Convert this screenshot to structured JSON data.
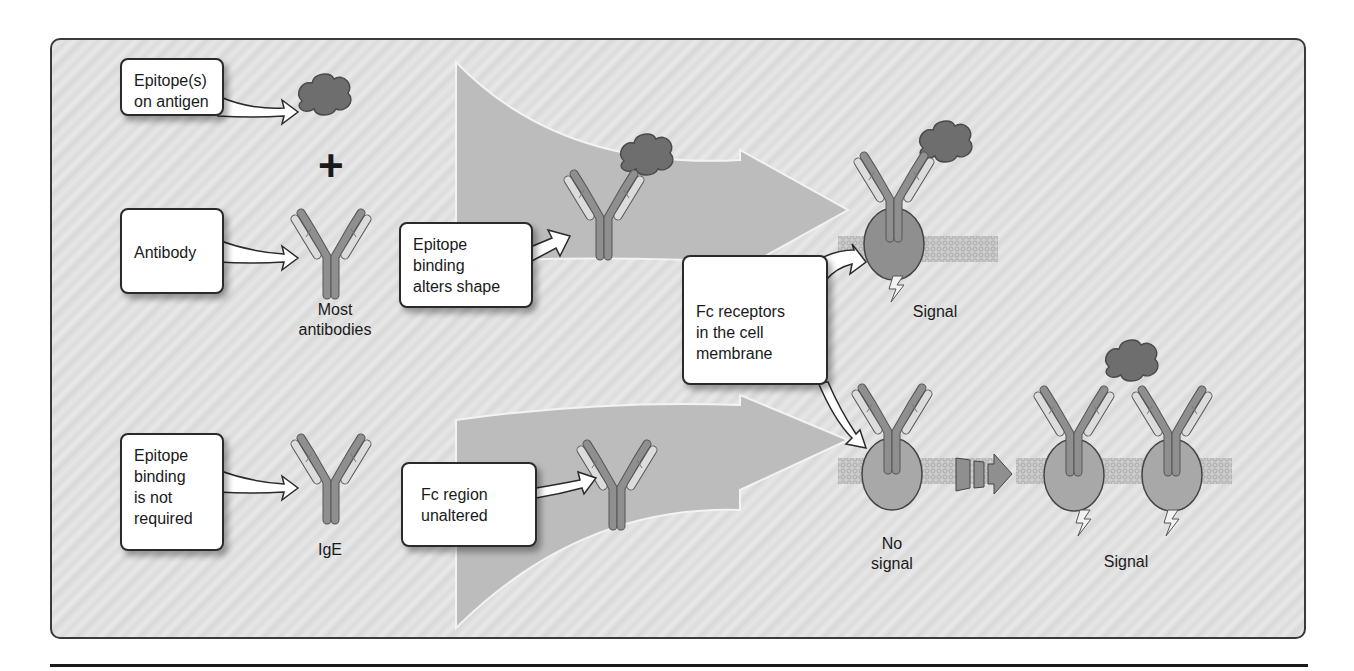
{
  "diagram": {
    "colors": {
      "background_light": "#e4e4e4",
      "background_stripe": "#d6d6d6",
      "flow_arrow_fill": "#bdbdbd",
      "antigen_fill": "#6e6e6e",
      "heavy_chain": "#8c8c8c",
      "light_chain": "#d9d9d9",
      "receptor_fill": "#a8a8a8",
      "membrane": "#b8b8b8",
      "frame_border": "#3a3a3a",
      "callout_fill": "#ffffff"
    },
    "callouts": {
      "epitope_on_antigen": "Epitope(s)\non antigen",
      "antibody": "Antibody",
      "epitope_alters_shape": "Epitope\nbinding\nalters shape",
      "fc_receptors": "Fc receptors\nin the cell\nmembrane",
      "epitope_not_required": "Epitope\nbinding\nis not\nrequired",
      "fc_unaltered": "Fc region\nunaltered"
    },
    "labels": {
      "plus": "+",
      "most_antibodies": "Most\nantibodies",
      "ige": "IgE",
      "signal_top": "Signal",
      "no_signal": "No\nsignal",
      "signal_bottom": "Signal"
    },
    "icons": {
      "antigen": "antigen-blob-icon",
      "antibody": "antibody-y-icon",
      "receptor": "fc-receptor-icon",
      "membrane": "lipid-bilayer-icon",
      "signal": "lightning-bolt-icon",
      "progress": "stepped-arrow-icon"
    }
  }
}
